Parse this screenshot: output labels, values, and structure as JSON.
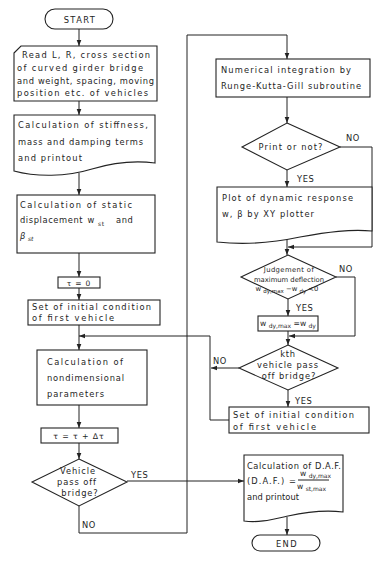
{
  "diagram": {
    "type": "flowchart",
    "colors": {
      "line": "#232323",
      "background": "#ffffff",
      "text": "#1e1e1e"
    }
  },
  "nodes": {
    "start": "START",
    "read_input": [
      "Read L, R, cross section",
      "of curved girder bridge",
      "and weight, spacing, moving",
      "position etc. of vehicles"
    ],
    "stiffness_calc": [
      "Calculation of stiffness,",
      "mass and damping terms",
      "and printout"
    ],
    "static_displacement": {
      "line1": "Calculation of static",
      "line2_text": "displacement",
      "line2_var": "w",
      "line2_sub": "st",
      "line2_end": "and",
      "line3_var": "β",
      "line3_sub": "st"
    },
    "tau_init": "τ = 0",
    "initial_condition_left": [
      "Set of initial condition",
      "of first vehicle"
    ],
    "nondimensional_calc": [
      "Calculation of",
      "nondimensional",
      "parameters"
    ],
    "tau_increment": "τ = τ + Δτ",
    "vehicle_pass_decision": [
      "Vehicle",
      "pass off",
      "bridge?"
    ],
    "numerical_integration": [
      "Numerical integration by",
      "Runge-Kutta-Gill subroutine"
    ],
    "print_decision": "Print or not?",
    "plot_response": [
      "Plot of dynamic response",
      "w, β by XY plotter"
    ],
    "judgement_decision": {
      "line1": "Judgement of",
      "line2": "maximum deflection",
      "w1": "w",
      "sub1": "dy,max",
      "minus": "−w",
      "sub2": "dy",
      "end": "<0"
    },
    "update_max": {
      "w1": "w",
      "sub1": "dy,max",
      "eq": "=w",
      "sub2": "dy"
    },
    "kth_vehicle_decision": [
      "kth",
      "vehicle pass",
      "off bridge?"
    ],
    "initial_condition_right": [
      "Set of initial condition",
      "of first vehicle"
    ],
    "daf_calc": {
      "line1": "Calculation of D.A.F.",
      "line2": "(D.A.F.) =",
      "num_w": "w",
      "num_sub": "dy,max",
      "den_w": "w",
      "den_sub": "st,max",
      "line3": "and printout"
    },
    "end": "END"
  },
  "edge_labels": {
    "vehicle_pass_yes": "YES",
    "vehicle_pass_no": "NO",
    "print_no": "NO",
    "print_yes": "YES",
    "judgement_no": "NO",
    "judgement_yes": "YES",
    "kth_no": "NO",
    "kth_yes": "YES"
  },
  "edges": [
    {
      "from": "start",
      "to": "read_input"
    },
    {
      "from": "read_input",
      "to": "stiffness_calc"
    },
    {
      "from": "stiffness_calc",
      "to": "static_displacement"
    },
    {
      "from": "static_displacement",
      "to": "tau_init"
    },
    {
      "from": "tau_init",
      "to": "initial_condition_left"
    },
    {
      "from": "initial_condition_left",
      "to": "nondimensional_calc"
    },
    {
      "from": "nondimensional_calc",
      "to": "tau_increment"
    },
    {
      "from": "tau_increment",
      "to": "vehicle_pass_decision"
    },
    {
      "from": "vehicle_pass_decision",
      "to": "daf_calc",
      "label": "YES"
    },
    {
      "from": "vehicle_pass_decision",
      "to": "numerical_integration",
      "label": "NO"
    },
    {
      "from": "numerical_integration",
      "to": "print_decision"
    },
    {
      "from": "print_decision",
      "to": "plot_response",
      "label": "YES"
    },
    {
      "from": "print_decision",
      "to": "judgement_decision",
      "label": "NO"
    },
    {
      "from": "plot_response",
      "to": "judgement_decision"
    },
    {
      "from": "judgement_decision",
      "to": "update_max",
      "label": "YES"
    },
    {
      "from": "judgement_decision",
      "to": "kth_vehicle_decision",
      "label": "NO"
    },
    {
      "from": "update_max",
      "to": "kth_vehicle_decision"
    },
    {
      "from": "kth_vehicle_decision",
      "to": "initial_condition_right",
      "label": "YES"
    },
    {
      "from": "kth_vehicle_decision",
      "to": "nondimensional_calc",
      "label": "NO"
    },
    {
      "from": "initial_condition_right",
      "to": "nondimensional_calc"
    },
    {
      "from": "daf_calc",
      "to": "end"
    }
  ]
}
